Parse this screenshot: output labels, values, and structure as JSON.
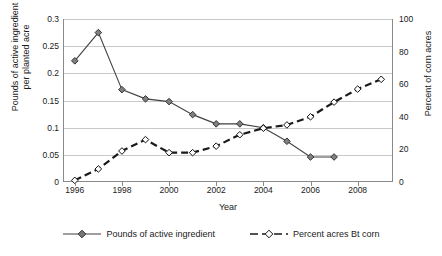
{
  "chart_data": {
    "type": "line",
    "title": "",
    "xlabel": "Year",
    "ylabel": "Pounds of active ingredient per planted acre",
    "y2label": "Percent of corn acres",
    "x": [
      1996,
      1997,
      1998,
      1999,
      2000,
      2001,
      2002,
      2003,
      2004,
      2005,
      2006,
      2007,
      2008,
      2009
    ],
    "xlim": [
      1995.5,
      2009.5
    ],
    "ylim": [
      0,
      0.3
    ],
    "y2lim": [
      0,
      100
    ],
    "yticks": [
      "0",
      "0.05",
      "0.1",
      "0.15",
      "0.2",
      "0.25",
      "0.3"
    ],
    "ytick_values": [
      0,
      0.05,
      0.1,
      0.15,
      0.2,
      0.25,
      0.3
    ],
    "y2ticks": [
      "0",
      "20",
      "40",
      "60",
      "80",
      "100"
    ],
    "y2tick_values": [
      0,
      20,
      40,
      60,
      80,
      100
    ],
    "xticks": [
      "1996",
      "1998",
      "2000",
      "2002",
      "2004",
      "2006",
      "2008"
    ],
    "xtick_values": [
      1996,
      1998,
      2000,
      2002,
      2004,
      2006,
      2008
    ],
    "grid": true,
    "legend_position": "bottom",
    "series": [
      {
        "name": "Pounds of active ingredient",
        "axis": "left",
        "marker": "filled-diamond",
        "linestyle": "solid",
        "color": "#404040",
        "x": [
          1996,
          1997,
          1998,
          1999,
          2000,
          2001,
          2002,
          2003,
          2004,
          2005,
          2006,
          2007
        ],
        "values": [
          0.223,
          0.275,
          0.17,
          0.153,
          0.148,
          0.124,
          0.107,
          0.107,
          0.1,
          0.075,
          0.046,
          0.046
        ]
      },
      {
        "name": "Percent acres Bt corn",
        "axis": "right",
        "marker": "open-diamond",
        "linestyle": "dashed",
        "color": "#1a1a1a",
        "x": [
          1996,
          1997,
          1998,
          1999,
          2000,
          2001,
          2002,
          2003,
          2004,
          2005,
          2006,
          2007,
          2008,
          2009
        ],
        "values": [
          1,
          8,
          19,
          26,
          18,
          18,
          22,
          29,
          33,
          35,
          40,
          49,
          57,
          63
        ]
      }
    ]
  },
  "legend": {
    "items": [
      {
        "label": "Pounds of active ingredient",
        "style": "solid-filled"
      },
      {
        "label": "Percent acres Bt corn",
        "style": "dashed-open"
      }
    ]
  },
  "axes": {
    "x_title": "Year",
    "y_left_title_line1": "Pounds of active ingredient",
    "y_left_title_line2": "per planted acre",
    "y_right_title": "Percent of corn acres"
  },
  "colors": {
    "series1": "#404040",
    "series2": "#1a1a1a",
    "grid": "#c9c9c9",
    "axis": "#8a8a8a",
    "background": "#ffffff"
  }
}
